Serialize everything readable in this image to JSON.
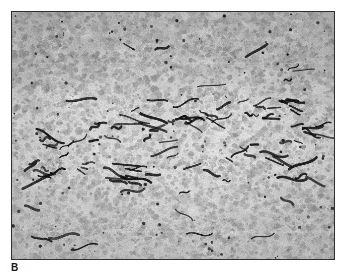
{
  "figure": {
    "panel_label": "B",
    "image_type": "histopathology micrograph",
    "modality": "light microscopy, immunohistochemistry counterstain",
    "color_mode": "grayscale",
    "frame": {
      "border_color": "#2f2f2f",
      "border_width_px": 1.5,
      "x": 11,
      "y": 11,
      "width": 324,
      "height": 249
    },
    "page_background": "#ffffff",
    "tissue": {
      "background_color": "#d8d8d8",
      "cell_color_light": "#c3c3c3",
      "cell_color_mid": "#a6a6a6",
      "cell_color_dark": "#8d8d8d",
      "stain_color": "#141414",
      "description": "Densely packed tumor cell sheet with interspersed immunostained microvessels"
    },
    "regions": [
      {
        "name": "upper-field",
        "tone": "darker, dense cellular sheet",
        "y_fraction": [
          0.0,
          0.33
        ]
      },
      {
        "name": "mid-field",
        "tone": "lighter with stained vessel band",
        "y_fraction": [
          0.33,
          0.72
        ]
      },
      {
        "name": "lower-field",
        "tone": "mid-tone cellular sheet",
        "y_fraction": [
          0.72,
          1.0
        ]
      }
    ],
    "stained_structures": {
      "count": 58,
      "appearance": "short dark elongated curvilinear microvessel profiles",
      "concentration_band_y_fraction": [
        0.38,
        0.68
      ]
    }
  }
}
